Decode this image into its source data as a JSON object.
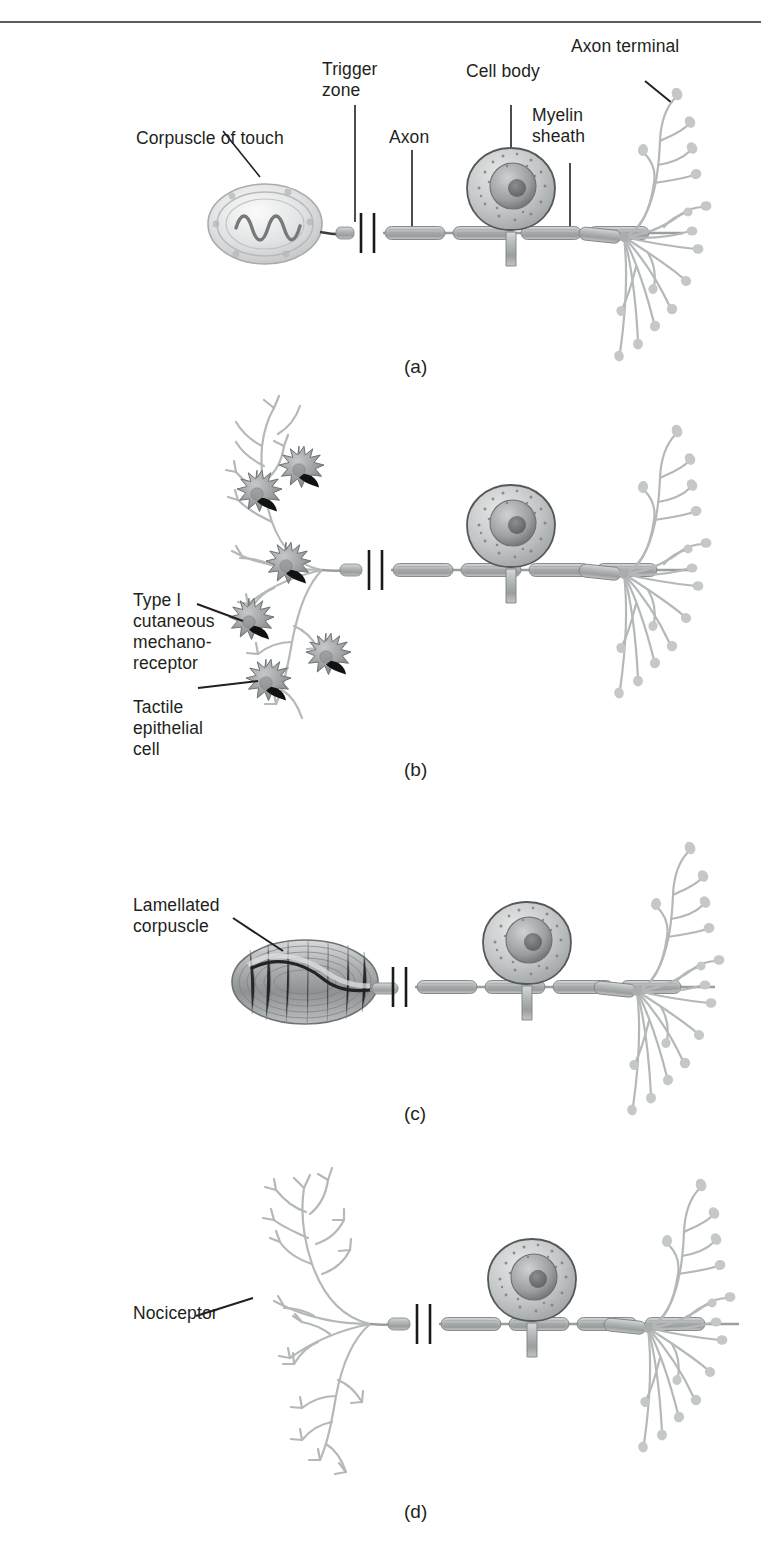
{
  "figure": {
    "type": "diagram",
    "background_color": "#ffffff",
    "rule_color": "#5b5b5f",
    "ink_color": "#231f20",
    "neuron_fill": "#b9bcbd",
    "neuron_stroke": "#8e9294",
    "receptor_dark": "#1a1a1a"
  },
  "panels": [
    {
      "key": "a",
      "caption": "(a)",
      "labels": [
        {
          "name": "corpuscle-of-touch",
          "text": "Corpuscle of touch"
        },
        {
          "name": "trigger-zone",
          "text": "Trigger\nzone"
        },
        {
          "name": "axon",
          "text": "Axon"
        },
        {
          "name": "cell-body",
          "text": "Cell body"
        },
        {
          "name": "myelin-sheath",
          "text": "Myelin\nsheath"
        },
        {
          "name": "axon-terminal",
          "text": "Axon terminal"
        }
      ]
    },
    {
      "key": "b",
      "caption": "(b)",
      "labels": [
        {
          "name": "type-i-cutaneous-mechanoreceptor",
          "text": "Type I\ncutaneous\nmechano-\nreceptor"
        },
        {
          "name": "tactile-epithelial-cell",
          "text": "Tactile\nepithelial\ncell"
        }
      ]
    },
    {
      "key": "c",
      "caption": "(c)",
      "labels": [
        {
          "name": "lamellated-corpuscle",
          "text": "Lamellated\ncorpuscle"
        }
      ]
    },
    {
      "key": "d",
      "caption": "(d)",
      "labels": [
        {
          "name": "nociceptor",
          "text": "Nociceptor"
        }
      ]
    }
  ],
  "captions": {
    "a": "(a)",
    "b": "(b)",
    "c": "(c)",
    "d": "(d)"
  },
  "label_text": {
    "corpuscle_of_touch": "Corpuscle of touch",
    "trigger_zone_l1": "Trigger",
    "trigger_zone_l2": "zone",
    "axon": "Axon",
    "cell_body": "Cell body",
    "myelin_sheath_l1": "Myelin",
    "myelin_sheath_l2": "sheath",
    "axon_terminal": "Axon terminal",
    "type_i_l1": "Type I",
    "type_i_l2": "cutaneous",
    "type_i_l3": "mechano-",
    "type_i_l4": "receptor",
    "tactile_l1": "Tactile",
    "tactile_l2": "epithelial",
    "tactile_l3": "cell",
    "lamellated_l1": "Lamellated",
    "lamellated_l2": "corpuscle",
    "nociceptor": "Nociceptor"
  }
}
